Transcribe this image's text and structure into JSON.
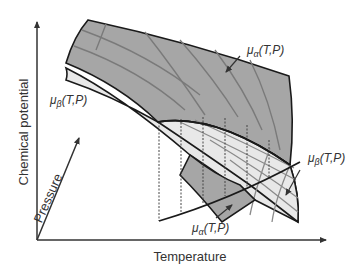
{
  "diagram": {
    "title": "",
    "axes": {
      "y_label": "Chemical potential",
      "x_label": "Temperature",
      "depth_label": "Pressure"
    },
    "surfaces": [
      {
        "name": "alpha",
        "label_mu": "μ",
        "label_sub": "α",
        "label_args": "(T,P)",
        "fill": "#a6a6a6",
        "role": "upper surface"
      },
      {
        "name": "beta",
        "label_mu": "μ",
        "label_sub": "β",
        "label_args": "(T,P)",
        "fill": "#e8e8e8",
        "role": "lower surface"
      }
    ],
    "annotations": [
      {
        "id": "alpha-top",
        "text_mu": "μ",
        "text_sub": "α",
        "text_args": "(T,P)"
      },
      {
        "id": "beta-left",
        "text_mu": "μ",
        "text_sub": "β",
        "text_args": "(T,P)"
      },
      {
        "id": "beta-right",
        "text_mu": "μ",
        "text_sub": "β",
        "text_args": "(T,P)"
      },
      {
        "id": "alpha-bottom",
        "text_mu": "μ",
        "text_sub": "α",
        "text_args": "(T,P)"
      }
    ],
    "dashed_projection_count": 6,
    "colors": {
      "axis": "#333333",
      "alpha_fill": "#a6a6a6",
      "beta_fill": "#e8e8e8",
      "grid_line": "#7a7a7a",
      "edge": "#1a1a1a"
    }
  }
}
